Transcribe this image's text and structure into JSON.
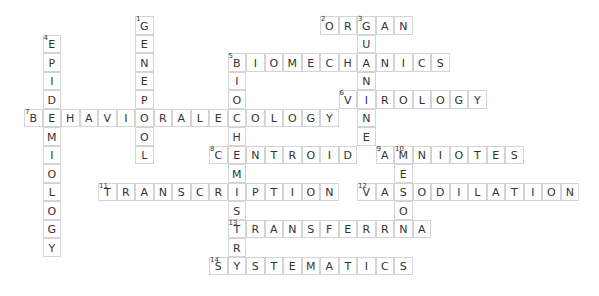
{
  "puzzle": {
    "cell_size": 18.5,
    "origin_x": 24,
    "origin_y": 16,
    "words": [
      {
        "number": 1,
        "direction": "down",
        "answer": "GENEPOOL",
        "row": 0,
        "col": 6
      },
      {
        "number": 2,
        "direction": "across",
        "answer": "ORGAN",
        "row": 0,
        "col": 16
      },
      {
        "number": 3,
        "direction": "down",
        "answer": "GUANINE",
        "row": 0,
        "col": 18
      },
      {
        "number": 4,
        "direction": "down",
        "answer": "EPIDEMIOLOGY",
        "row": 1,
        "col": 1
      },
      {
        "number": 5,
        "direction": "across",
        "answer": "BIOMECHANICS",
        "row": 2,
        "col": 11
      },
      {
        "number": 5,
        "direction": "down",
        "answer": "BIOCHEMISTRY",
        "row": 2,
        "col": 11
      },
      {
        "number": 6,
        "direction": "across",
        "answer": "VIROLOGY",
        "row": 4,
        "col": 17
      },
      {
        "number": 7,
        "direction": "across",
        "answer": "BEHAVIORALECOLOGY",
        "row": 5,
        "col": 0
      },
      {
        "number": 8,
        "direction": "across",
        "answer": "CENTROID",
        "row": 7,
        "col": 10
      },
      {
        "number": 9,
        "direction": "across",
        "answer": "AMNIOTES",
        "row": 7,
        "col": 19
      },
      {
        "number": 10,
        "direction": "down",
        "answer": "MESON",
        "row": 7,
        "col": 20
      },
      {
        "number": 11,
        "direction": "across",
        "answer": "TRANSCRIPTION",
        "row": 9,
        "col": 4
      },
      {
        "number": 12,
        "direction": "across",
        "answer": "VASODILATION",
        "row": 9,
        "col": 18
      },
      {
        "number": 13,
        "direction": "across",
        "answer": "TRANSFERRNA",
        "row": 11,
        "col": 11
      },
      {
        "number": 14,
        "direction": "across",
        "answer": "SYSTEMATICS",
        "row": 13,
        "col": 10
      }
    ]
  }
}
